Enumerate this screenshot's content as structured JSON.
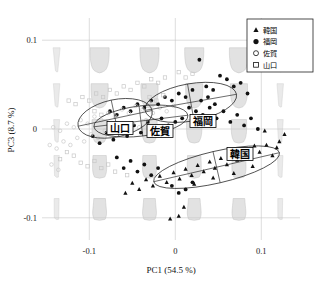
{
  "figure": {
    "kind": "pca-biplot",
    "background": "#ffffff"
  },
  "axes": {
    "x_label": "PC1 (54.5 %)",
    "y_label": "PC3 (8.7 %)",
    "x_ticks": [
      "-0.1",
      "0",
      "0.1"
    ],
    "y_ticks": [
      "0.1",
      "0",
      "-0.1"
    ]
  },
  "legend": {
    "items": [
      {
        "label": "韓国",
        "marker": "filled-triangle"
      },
      {
        "label": "福岡",
        "marker": "filled-circle"
      },
      {
        "label": "佐賀",
        "marker": "open-circle"
      },
      {
        "label": "山口",
        "marker": "open-square"
      }
    ]
  },
  "group_labels": [
    {
      "label": "山口",
      "x": 120,
      "y": 128
    },
    {
      "label": "佐賀",
      "x": 160,
      "y": 131
    },
    {
      "label": "福岡",
      "x": 203,
      "y": 121
    },
    {
      "label": "韓国",
      "x": 240,
      "y": 154
    }
  ],
  "chart_data": {
    "type": "scatter",
    "title": "",
    "xlabel": "PC1 (54.5 %)",
    "ylabel": "PC3 (8.7 %)",
    "xlim": [
      -0.155,
      0.145
    ],
    "ylim": [
      -0.125,
      0.125
    ],
    "xticks": [
      -0.1,
      0,
      0.1
    ],
    "yticks": [
      -0.1,
      0,
      0.1
    ],
    "grid": true,
    "legend_position": "top-right",
    "series": [
      {
        "name": "韓国",
        "marker": "filled-triangle",
        "color": "#111111",
        "points": [
          [
            0.127,
            -0.006
          ],
          [
            0.121,
            -0.014
          ],
          [
            0.118,
            -0.021
          ],
          [
            0.106,
            -0.018
          ],
          [
            0.098,
            -0.026
          ],
          [
            0.092,
            -0.019
          ],
          [
            0.086,
            -0.031
          ],
          [
            0.079,
            -0.024
          ],
          [
            0.072,
            -0.035
          ],
          [
            0.066,
            -0.028
          ],
          [
            0.06,
            -0.04
          ],
          [
            0.053,
            -0.033
          ],
          [
            0.046,
            -0.044
          ],
          [
            0.04,
            -0.037
          ],
          [
            0.033,
            -0.048
          ],
          [
            0.026,
            -0.041
          ],
          [
            0.019,
            -0.052
          ],
          [
            0.012,
            -0.045
          ],
          [
            0.005,
            -0.056
          ],
          [
            -0.002,
            -0.049
          ],
          [
            -0.01,
            -0.06
          ],
          [
            -0.018,
            -0.053
          ],
          [
            -0.026,
            -0.064
          ],
          [
            -0.034,
            -0.057
          ],
          [
            -0.042,
            -0.068
          ],
          [
            -0.05,
            -0.061
          ],
          [
            -0.058,
            -0.072
          ],
          [
            0.004,
            -0.098
          ],
          [
            -0.006,
            -0.101
          ],
          [
            0.01,
            -0.088
          ],
          [
            0.104,
            -0.002
          ],
          [
            0.113,
            -0.03
          ],
          [
            0.09,
            -0.042
          ],
          [
            0.068,
            -0.05
          ],
          [
            0.044,
            -0.055
          ],
          [
            0.022,
            -0.062
          ]
        ]
      },
      {
        "name": "福岡",
        "marker": "filled-circle",
        "color": "#111111",
        "points": [
          [
            0.028,
            0.078
          ],
          [
            0.052,
            0.06
          ],
          [
            0.06,
            0.056
          ],
          [
            0.036,
            0.048
          ],
          [
            0.044,
            0.044
          ],
          [
            0.068,
            0.048
          ],
          [
            0.076,
            0.052
          ],
          [
            0.084,
            0.04
          ],
          [
            0.02,
            0.044
          ],
          [
            0.012,
            0.036
          ],
          [
            0.004,
            0.04
          ],
          [
            -0.004,
            0.032
          ],
          [
            -0.012,
            0.036
          ],
          [
            -0.02,
            0.028
          ],
          [
            -0.028,
            0.032
          ],
          [
            -0.036,
            0.024
          ],
          [
            -0.044,
            0.028
          ],
          [
            -0.052,
            0.02
          ],
          [
            -0.06,
            0.024
          ],
          [
            -0.068,
            0.016
          ],
          [
            -0.076,
            0.02
          ],
          [
            0.016,
            0.024
          ],
          [
            0.024,
            0.02
          ],
          [
            0.032,
            0.016
          ],
          [
            0.04,
            0.024
          ],
          [
            0.048,
            0.012
          ],
          [
            0.056,
            0.02
          ],
          [
            0.064,
            0.008
          ],
          [
            0.072,
            0.016
          ],
          [
            0.08,
            0.004
          ],
          [
            0.088,
            0.012
          ],
          [
            0.096,
            0.0
          ],
          [
            0.008,
            0.012
          ],
          [
            0.0,
            0.008
          ],
          [
            -0.008,
            0.004
          ],
          [
            -0.016,
            0.012
          ],
          [
            -0.024,
            0.0
          ],
          [
            -0.032,
            0.008
          ],
          [
            -0.04,
            -0.004
          ],
          [
            -0.048,
            0.004
          ],
          [
            -0.056,
            -0.008
          ],
          [
            -0.064,
            0.0
          ],
          [
            -0.072,
            -0.012
          ],
          [
            -0.08,
            -0.004
          ],
          [
            -0.088,
            -0.016
          ],
          [
            -0.096,
            -0.008
          ],
          [
            -0.052,
            -0.036
          ],
          [
            -0.06,
            -0.044
          ],
          [
            -0.068,
            -0.032
          ],
          [
            -0.044,
            -0.048
          ],
          [
            -0.036,
            -0.04
          ],
          [
            -0.028,
            -0.052
          ],
          [
            -0.02,
            -0.044
          ],
          [
            0.012,
            -0.068
          ],
          [
            0.004,
            -0.072
          ],
          [
            -0.004,
            -0.064
          ],
          [
            0.02,
            -0.06
          ],
          [
            0.03,
            0.032
          ],
          [
            0.038,
            0.036
          ],
          [
            0.046,
            0.028
          ]
        ]
      },
      {
        "name": "佐賀",
        "marker": "open-circle",
        "color": "#c8c8c8",
        "points": [
          [
            -0.03,
            0.03
          ],
          [
            -0.038,
            0.022
          ],
          [
            -0.046,
            0.026
          ],
          [
            -0.054,
            0.018
          ],
          [
            -0.062,
            0.022
          ],
          [
            -0.07,
            0.014
          ],
          [
            -0.078,
            0.018
          ],
          [
            -0.086,
            0.01
          ],
          [
            -0.094,
            0.014
          ],
          [
            -0.102,
            0.006
          ],
          [
            -0.11,
            0.01
          ],
          [
            -0.118,
            0.002
          ],
          [
            -0.126,
            0.006
          ],
          [
            -0.134,
            -0.002
          ],
          [
            -0.142,
            0.002
          ],
          [
            -0.034,
            0.01
          ],
          [
            -0.042,
            0.002
          ],
          [
            -0.05,
            0.006
          ],
          [
            -0.058,
            -0.002
          ],
          [
            -0.066,
            0.002
          ],
          [
            -0.074,
            -0.006
          ],
          [
            -0.082,
            -0.002
          ],
          [
            -0.09,
            -0.01
          ],
          [
            -0.098,
            -0.006
          ],
          [
            -0.106,
            -0.014
          ],
          [
            -0.114,
            -0.01
          ],
          [
            -0.122,
            -0.018
          ],
          [
            -0.13,
            -0.014
          ],
          [
            -0.138,
            -0.022
          ],
          [
            -0.146,
            -0.018
          ],
          [
            -0.026,
            0.018
          ],
          [
            -0.018,
            0.024
          ],
          [
            -0.01,
            0.02
          ],
          [
            -0.002,
            0.026
          ],
          [
            -0.144,
            -0.04
          ],
          [
            -0.136,
            -0.046
          ]
        ]
      },
      {
        "name": "山口",
        "marker": "open-square",
        "color": "#c8c8c8",
        "points": [
          [
            -0.012,
            0.058
          ],
          [
            -0.02,
            0.052
          ],
          [
            -0.028,
            0.056
          ],
          [
            -0.036,
            0.048
          ],
          [
            -0.044,
            0.052
          ],
          [
            -0.052,
            0.044
          ],
          [
            -0.06,
            0.048
          ],
          [
            -0.068,
            0.04
          ],
          [
            -0.076,
            0.044
          ],
          [
            -0.084,
            0.036
          ],
          [
            -0.092,
            0.04
          ],
          [
            -0.1,
            0.032
          ],
          [
            -0.108,
            0.036
          ],
          [
            -0.116,
            0.028
          ],
          [
            -0.124,
            0.032
          ],
          [
            -0.014,
            0.038
          ],
          [
            -0.022,
            0.032
          ],
          [
            -0.03,
            0.036
          ],
          [
            -0.086,
            0.016
          ],
          [
            -0.094,
            0.02
          ],
          [
            -0.118,
            -0.03
          ],
          [
            -0.126,
            -0.026
          ],
          [
            -0.134,
            -0.034
          ],
          [
            -0.11,
            -0.038
          ],
          [
            -0.102,
            -0.042
          ],
          [
            -0.094,
            -0.036
          ],
          [
            -0.086,
            -0.044
          ],
          [
            -0.078,
            -0.04
          ],
          [
            -0.07,
            -0.048
          ],
          [
            0.004,
            0.064
          ],
          [
            0.012,
            0.058
          ],
          [
            0.02,
            0.062
          ],
          [
            -0.056,
            -0.052
          ]
        ]
      }
    ],
    "ellipses": [
      {
        "group": "山口",
        "cx": -0.07,
        "cy": 0.012,
        "rx": 0.044,
        "ry": 0.021,
        "angle": -12
      },
      {
        "group": "佐賀",
        "cx": -0.04,
        "cy": 0.009,
        "rx": 0.055,
        "ry": 0.017,
        "angle": -7
      },
      {
        "group": "福岡",
        "cx": 0.018,
        "cy": 0.03,
        "rx": 0.054,
        "ry": 0.021,
        "angle": -10
      },
      {
        "group": "韓国",
        "cx": 0.048,
        "cy": -0.043,
        "rx": 0.075,
        "ry": 0.018,
        "angle": -13
      }
    ],
    "shape_grid": {
      "description": "reconstructed vessel outlines across PC1/PC3 space",
      "fill": "#d9d9d9",
      "stroke": "#a8a8a8",
      "x_positions": [
        -0.138,
        -0.088,
        -0.03,
        0.022,
        0.074,
        0.122
      ],
      "y_positions": [
        0.078,
        0.038,
        -0.002,
        -0.042,
        -0.09
      ]
    }
  }
}
